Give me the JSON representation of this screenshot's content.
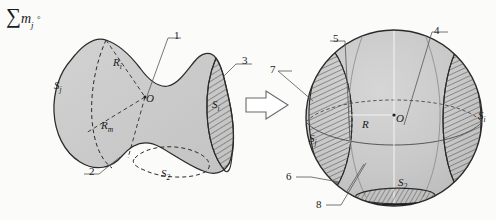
{
  "figure": {
    "caption_formula": {
      "sum_symbol": "∑",
      "variable": "m",
      "subscript": "j",
      "terminator": "◦"
    },
    "arrow": {
      "name": "transformation-arrow",
      "direction": "right"
    },
    "left_shape": {
      "name": "irregular-body",
      "labels": [
        {
          "id": "left-label-1",
          "text": "1",
          "x": 174,
          "y": 30
        },
        {
          "id": "left-label-2",
          "text": "2",
          "x": 89,
          "y": 166
        },
        {
          "id": "left-label-3",
          "text": "3",
          "x": 242,
          "y": 55
        }
      ],
      "math_labels": [
        {
          "id": "left-Sj",
          "text": "S",
          "sub": "j",
          "x": 54,
          "y": 80
        },
        {
          "id": "left-Ri",
          "text": "R",
          "sub": "i",
          "x": 113,
          "y": 57
        },
        {
          "id": "left-Rm",
          "text": "R",
          "sub": "m",
          "x": 101,
          "y": 120
        },
        {
          "id": "left-O",
          "text": "O",
          "sub": "",
          "x": 146,
          "y": 93
        },
        {
          "id": "left-Si",
          "text": "S",
          "sub": "i",
          "x": 212,
          "y": 99
        },
        {
          "id": "left-S2",
          "text": "S",
          "sub": "2",
          "x": 161,
          "y": 168
        }
      ]
    },
    "right_shape": {
      "name": "equivalent-sphere",
      "labels": [
        {
          "id": "right-label-4",
          "text": "4",
          "x": 434,
          "y": 25
        },
        {
          "id": "right-label-5",
          "text": "5",
          "x": 333,
          "y": 33
        },
        {
          "id": "right-label-6",
          "text": "6",
          "x": 302,
          "y": 172
        },
        {
          "id": "right-label-7",
          "text": "7",
          "x": 282,
          "y": 64
        },
        {
          "id": "right-label-8",
          "text": "8",
          "x": 331,
          "y": 199
        }
      ],
      "math_labels": [
        {
          "id": "right-Sj",
          "text": "S",
          "sub": "j",
          "x": 309,
          "y": 133
        },
        {
          "id": "right-R",
          "text": "R",
          "sub": "",
          "x": 362,
          "y": 119
        },
        {
          "id": "right-O",
          "text": "O",
          "sub": "",
          "x": 394,
          "y": 111
        },
        {
          "id": "right-Si",
          "text": "S",
          "sub": "i",
          "x": 478,
          "y": 110
        },
        {
          "id": "right-S2",
          "text": "S",
          "sub": "2",
          "x": 398,
          "y": 177
        }
      ]
    },
    "colors": {
      "body_fill": "#c9c9c9",
      "outline": "#2b2b2b",
      "hatch": "#4a4a4a",
      "leader": "#555555",
      "background": "#fbfbfa"
    }
  }
}
